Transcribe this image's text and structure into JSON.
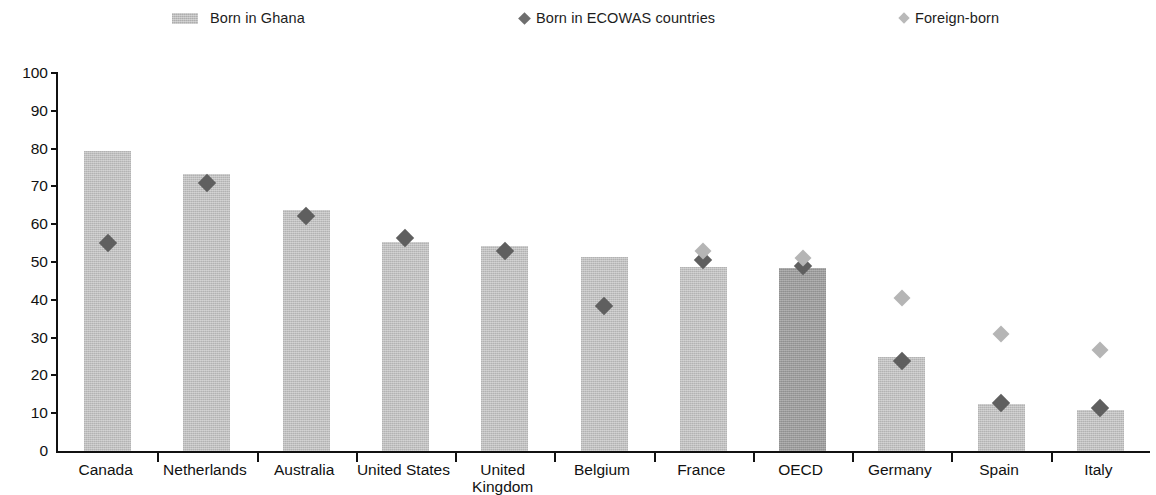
{
  "legend": {
    "items": [
      {
        "label": "Born in Ghana",
        "marker": "square-swatch-icon",
        "color": "#bdbdbd",
        "x": 172
      },
      {
        "label": "Born in ECOWAS countries",
        "marker": "diamond-dark-icon",
        "color": "#6e6e6e",
        "x": 520
      },
      {
        "label": "Born in Ghana foreign-born",
        "display_label": "Foreign-born",
        "marker": "diamond-light-icon",
        "color": "#b9b9b9",
        "x": 900
      }
    ]
  },
  "axis": {
    "y_ticks": [
      "100",
      "90",
      "80",
      "70",
      "60",
      "50",
      "40",
      "30",
      "20",
      "10",
      "0"
    ],
    "y_min": 0,
    "y_max": 100
  },
  "chart_data": {
    "type": "bar",
    "title": "",
    "subtitle": "",
    "xlabel": "",
    "ylabel": "",
    "ylim": [
      0,
      100
    ],
    "grid": false,
    "legend_position": "top",
    "categories": [
      "Canada",
      "Netherlands",
      "Australia",
      "United States",
      "United\nKingdom",
      "Belgium",
      "France",
      "OECD",
      "Germany",
      "Spain",
      "Italy"
    ],
    "series": [
      {
        "name": "Born in Ghana",
        "type": "bar",
        "values": [
          79.3,
          73.4,
          63.7,
          55.2,
          54.2,
          51.2,
          48.8,
          48.3,
          24.9,
          12.4,
          10.8
        ]
      },
      {
        "name": "Born in ECOWAS countries",
        "type": "marker-diamond",
        "values": [
          54.9,
          71.0,
          62.1,
          56.3,
          53.0,
          38.4,
          50.6,
          48.9,
          23.9,
          12.7,
          11.3
        ]
      },
      {
        "name": "Foreign-born",
        "type": "marker-diamond-light",
        "values": [
          null,
          null,
          null,
          null,
          null,
          null,
          52.9,
          51.1,
          40.4,
          31.0,
          26.6
        ]
      }
    ],
    "highlight_category": "OECD"
  }
}
